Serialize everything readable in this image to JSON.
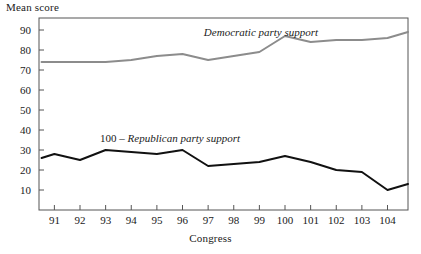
{
  "figure": {
    "ylabel_title": "Mean score",
    "xlabel_title": "Congress"
  },
  "annotations": {
    "democratic": "Democratic party support",
    "republican_prefix": "100 – ",
    "republican": "Republican party support"
  },
  "colors": {
    "democratic_line": "#8c8c8c",
    "republican_line": "#111111",
    "axis": "#555555",
    "text": "#1a1a1a",
    "background": "#ffffff"
  },
  "chart_data": {
    "type": "line",
    "title": "",
    "xlabel": "Congress",
    "ylabel": "Mean score",
    "xlim": [
      90.4,
      104.8
    ],
    "ylim": [
      0,
      96
    ],
    "grid": false,
    "legend": "inline-annotations",
    "x_ticks": [
      91,
      92,
      93,
      94,
      95,
      96,
      97,
      98,
      99,
      100,
      101,
      102,
      103,
      104
    ],
    "y_ticks": [
      10,
      20,
      30,
      40,
      50,
      60,
      70,
      80,
      90
    ],
    "x": [
      90.5,
      91,
      92,
      93,
      94,
      95,
      96,
      97,
      98,
      99,
      100,
      101,
      102,
      103,
      104,
      104.8
    ],
    "series": [
      {
        "name": "Democratic party support",
        "color": "#8c8c8c",
        "width": 2,
        "values": [
          74,
          74,
          74,
          74,
          75,
          77,
          78,
          75,
          77,
          79,
          87,
          84,
          85,
          85,
          86,
          89
        ]
      },
      {
        "name": "100 – Republican party support",
        "color": "#111111",
        "width": 2,
        "values": [
          26,
          28,
          25,
          30,
          29,
          28,
          30,
          22,
          23,
          24,
          27,
          24,
          20,
          19,
          10,
          13
        ]
      }
    ]
  }
}
